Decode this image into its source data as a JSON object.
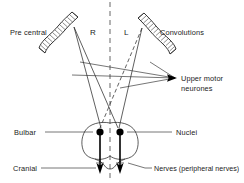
{
  "figure": {
    "background_color": "#ffffff",
    "ink_color": "#2b2b2b",
    "midline_color": "#555555"
  },
  "labels": {
    "pre_central": "Pre central",
    "right_side": "R",
    "left_side": "L",
    "convolutions": "Convolutions",
    "upper_motor_line1": "Upper motor",
    "upper_motor_line2": "neurones",
    "bulbar": "Bulbar",
    "nuclei": "Nuclei",
    "cranial": "Cranial",
    "nerves": "Nerves (peripheral nerves)"
  },
  "structures": {
    "left_convolution": "hatched-ribbon-left",
    "right_convolution": "hatched-ribbon-right",
    "midline": "vertical-dashed-midline",
    "decussation": "crossing-tracts",
    "bulb": "medulla-outline",
    "nucleus_left": "filled-dot-left",
    "nucleus_right": "filled-dot-right",
    "nerve_left": "downward-arrow-left",
    "nerve_right": "downward-arrow-right"
  }
}
